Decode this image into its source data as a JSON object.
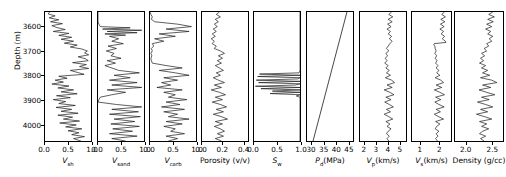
{
  "figure": {
    "kind": "well-log-panel",
    "n_tracks": 9,
    "y_axis": {
      "label": "Depth (m)",
      "ticks": [
        3600,
        3700,
        3800,
        3900,
        4000
      ],
      "tick_labels": [
        "3600",
        "3700",
        "3800",
        "3900",
        "4000"
      ],
      "range": [
        4070,
        3540
      ],
      "inverted": true,
      "units": "m"
    },
    "line_color": "#1a1a1a"
  },
  "chart_data": [
    {
      "type": "line",
      "name": "vsh",
      "title": "",
      "xlabel": "V_sh",
      "xlabel_base": "V",
      "xlabel_sub": "sh",
      "ylabel": "Depth (m)",
      "xticks": [
        0.0,
        0.5,
        1.0
      ],
      "xtick_labels": [
        "0.0",
        "0.5",
        "1.0"
      ],
      "xlim": [
        0.0,
        1.0
      ],
      "ylim": [
        4070,
        3540
      ],
      "grid": false,
      "x": [
        3540,
        3548,
        3556,
        3564,
        3572,
        3580,
        3588,
        3596,
        3604,
        3612,
        3620,
        3628,
        3636,
        3644,
        3652,
        3660,
        3668,
        3676,
        3684,
        3692,
        3700,
        3708,
        3716,
        3724,
        3732,
        3740,
        3748,
        3756,
        3764,
        3772,
        3780,
        3788,
        3796,
        3804,
        3812,
        3820,
        3828,
        3836,
        3844,
        3852,
        3860,
        3868,
        3876,
        3884,
        3892,
        3900,
        3908,
        3916,
        3924,
        3932,
        3940,
        3948,
        3956,
        3964,
        3972,
        3980,
        3988,
        3996,
        4004,
        4012,
        4020,
        4028,
        4036,
        4044,
        4052,
        4060,
        4070
      ],
      "values": [
        0.1,
        0.07,
        0.22,
        0.09,
        0.3,
        0.12,
        0.38,
        0.15,
        0.26,
        0.44,
        0.18,
        0.52,
        0.3,
        0.58,
        0.35,
        0.62,
        0.42,
        0.7,
        0.55,
        0.8,
        0.92,
        0.86,
        0.95,
        0.72,
        0.88,
        0.94,
        0.6,
        0.9,
        0.75,
        0.95,
        0.55,
        0.7,
        0.85,
        0.3,
        0.48,
        0.22,
        0.4,
        0.15,
        0.52,
        0.28,
        0.62,
        0.35,
        0.7,
        0.25,
        0.55,
        0.18,
        0.45,
        0.3,
        0.66,
        0.24,
        0.58,
        0.35,
        0.72,
        0.28,
        0.6,
        0.4,
        0.75,
        0.32,
        0.68,
        0.45,
        0.8,
        0.5,
        0.74,
        0.58,
        0.86,
        0.62,
        0.78
      ]
    },
    {
      "type": "line",
      "name": "vsand",
      "xlabel": "V_sand",
      "xlabel_base": "V",
      "xlabel_sub": "sand",
      "xticks": [
        0.0,
        0.5,
        1.0
      ],
      "xtick_labels": [
        "0.0",
        "0.5",
        "1.0"
      ],
      "xlim": [
        0.0,
        1.0
      ],
      "ylim": [
        4070,
        3540
      ],
      "grid": false,
      "x": [
        3540,
        3550,
        3560,
        3570,
        3580,
        3590,
        3600,
        3605,
        3610,
        3615,
        3620,
        3625,
        3630,
        3635,
        3640,
        3650,
        3660,
        3670,
        3680,
        3690,
        3700,
        3710,
        3720,
        3730,
        3740,
        3750,
        3760,
        3770,
        3780,
        3790,
        3800,
        3810,
        3820,
        3830,
        3840,
        3850,
        3860,
        3870,
        3880,
        3890,
        3900,
        3910,
        3920,
        3930,
        3940,
        3950,
        3960,
        3970,
        3980,
        3990,
        4000,
        4010,
        4020,
        4030,
        4040,
        4050,
        4060,
        4070
      ],
      "values": [
        0.0,
        0.0,
        0.0,
        0.0,
        0.0,
        0.02,
        0.05,
        0.7,
        0.1,
        0.95,
        0.2,
        0.85,
        0.15,
        0.6,
        0.25,
        0.45,
        0.3,
        0.55,
        0.22,
        0.4,
        0.18,
        0.35,
        0.28,
        0.5,
        0.2,
        0.38,
        0.15,
        0.3,
        0.45,
        0.9,
        0.35,
        0.7,
        0.25,
        0.85,
        0.3,
        0.95,
        0.2,
        0.6,
        0.3,
        0.05,
        0.02,
        0.0,
        0.4,
        0.95,
        0.3,
        0.88,
        0.25,
        0.92,
        0.35,
        0.8,
        0.28,
        0.9,
        0.32,
        0.75,
        0.25,
        0.85,
        0.3,
        0.6
      ]
    },
    {
      "type": "line",
      "name": "vcarb",
      "xlabel": "V_carb",
      "xlabel_base": "V",
      "xlabel_sub": "carb",
      "xticks": [
        0.0,
        0.5,
        1.0
      ],
      "xtick_labels": [
        "0.0",
        "0.5",
        "1.0"
      ],
      "xlim": [
        0.0,
        1.0
      ],
      "ylim": [
        4070,
        3540
      ],
      "grid": false,
      "x": [
        3540,
        3550,
        3560,
        3570,
        3580,
        3590,
        3600,
        3610,
        3620,
        3630,
        3640,
        3650,
        3660,
        3670,
        3680,
        3690,
        3700,
        3710,
        3720,
        3730,
        3740,
        3750,
        3760,
        3770,
        3780,
        3790,
        3800,
        3810,
        3820,
        3830,
        3840,
        3850,
        3860,
        3870,
        3880,
        3890,
        3900,
        3910,
        3920,
        3930,
        3940,
        3950,
        3960,
        3970,
        3980,
        3990,
        4000,
        4010,
        4020,
        4030,
        4040,
        4050,
        4060,
        4070
      ],
      "values": [
        0.0,
        0.02,
        0.05,
        0.03,
        0.1,
        0.6,
        0.9,
        0.35,
        0.85,
        0.2,
        0.55,
        0.1,
        0.3,
        0.05,
        0.08,
        0.03,
        0.05,
        0.02,
        0.04,
        0.02,
        0.03,
        0.05,
        0.35,
        0.7,
        0.2,
        0.55,
        0.85,
        0.3,
        0.6,
        0.25,
        0.45,
        0.15,
        0.7,
        0.3,
        0.55,
        0.4,
        0.8,
        0.35,
        0.65,
        0.25,
        0.75,
        0.3,
        0.6,
        0.4,
        0.85,
        0.35,
        0.7,
        0.3,
        0.55,
        0.45,
        0.75,
        0.35,
        0.6,
        0.4
      ]
    },
    {
      "type": "line",
      "name": "porosity",
      "xlabel": "Porosity (v/v)",
      "xticks": [
        0.0,
        0.2,
        0.4
      ],
      "xtick_labels": [
        "0.0",
        "0.2",
        "0.4"
      ],
      "xlim": [
        0.0,
        0.45
      ],
      "ylim": [
        4070,
        3540
      ],
      "grid": false,
      "units": "v/v",
      "x": [
        3540,
        3550,
        3560,
        3570,
        3580,
        3590,
        3600,
        3610,
        3620,
        3630,
        3640,
        3650,
        3660,
        3670,
        3680,
        3690,
        3700,
        3710,
        3720,
        3730,
        3740,
        3750,
        3760,
        3770,
        3780,
        3790,
        3800,
        3810,
        3820,
        3830,
        3840,
        3850,
        3860,
        3870,
        3880,
        3890,
        3900,
        3910,
        3920,
        3930,
        3940,
        3950,
        3960,
        3970,
        3980,
        3990,
        4000,
        4010,
        4020,
        4030,
        4040,
        4050,
        4060,
        4070
      ],
      "values": [
        0.17,
        0.14,
        0.18,
        0.13,
        0.16,
        0.12,
        0.15,
        0.11,
        0.14,
        0.1,
        0.13,
        0.09,
        0.12,
        0.1,
        0.14,
        0.12,
        0.18,
        0.22,
        0.16,
        0.2,
        0.15,
        0.19,
        0.13,
        0.17,
        0.21,
        0.14,
        0.18,
        0.11,
        0.16,
        0.22,
        0.12,
        0.19,
        0.09,
        0.17,
        0.23,
        0.13,
        0.2,
        0.1,
        0.18,
        0.24,
        0.14,
        0.21,
        0.11,
        0.19,
        0.25,
        0.13,
        0.2,
        0.12,
        0.18,
        0.22,
        0.15,
        0.21,
        0.13,
        0.19
      ]
    },
    {
      "type": "line",
      "name": "sw",
      "xlabel": "S_w",
      "xlabel_base": "S",
      "xlabel_sub": "w",
      "xticks": [
        0.0,
        0.5,
        1.0
      ],
      "xtick_labels": [
        "0.0",
        "0.5",
        "1.0"
      ],
      "xlim": [
        0.0,
        1.0
      ],
      "ylim": [
        4070,
        3540
      ],
      "grid": false,
      "x": [
        3540,
        3600,
        3660,
        3720,
        3780,
        3790,
        3795,
        3800,
        3805,
        3810,
        3815,
        3820,
        3825,
        3830,
        3835,
        3840,
        3845,
        3850,
        3855,
        3860,
        3865,
        3870,
        3875,
        3880,
        3885,
        3890,
        3900,
        3960,
        4020,
        4070
      ],
      "values": [
        1.0,
        1.0,
        1.0,
        1.0,
        1.0,
        0.98,
        0.12,
        1.0,
        0.08,
        1.0,
        0.95,
        0.05,
        1.0,
        0.1,
        1.0,
        0.9,
        0.03,
        1.0,
        0.15,
        1.0,
        0.4,
        1.0,
        0.35,
        1.0,
        0.92,
        1.0,
        1.0,
        1.0,
        1.0,
        1.0
      ]
    },
    {
      "type": "line",
      "name": "pd",
      "xlabel": "P_d(MPa)",
      "xlabel_base": "P",
      "xlabel_sub": "d",
      "xlabel_suffix": "(MPa)",
      "xticks": [
        30,
        35,
        40,
        45
      ],
      "xtick_labels": [
        "30",
        "35",
        "40",
        "45"
      ],
      "xlim": [
        28,
        47
      ],
      "ylim": [
        4070,
        3540
      ],
      "grid": false,
      "units": "MPa",
      "x": [
        3540,
        4070
      ],
      "values": [
        44.5,
        30.5
      ]
    },
    {
      "type": "line",
      "name": "vp",
      "xlabel": "V_p(km/s)",
      "xlabel_base": "V",
      "xlabel_sub": "p",
      "xlabel_suffix": "(km/s)",
      "xticks": [
        2,
        3,
        4,
        5
      ],
      "xtick_labels": [
        "2",
        "3",
        "4",
        "5"
      ],
      "xlim": [
        1.6,
        5.6
      ],
      "ylim": [
        4070,
        3540
      ],
      "grid": false,
      "units": "km/s",
      "x": [
        3540,
        3550,
        3560,
        3570,
        3580,
        3590,
        3600,
        3610,
        3620,
        3630,
        3640,
        3650,
        3660,
        3670,
        3680,
        3690,
        3700,
        3710,
        3720,
        3730,
        3740,
        3750,
        3760,
        3770,
        3780,
        3790,
        3800,
        3810,
        3820,
        3830,
        3840,
        3850,
        3860,
        3870,
        3880,
        3890,
        3900,
        3910,
        3920,
        3930,
        3940,
        3950,
        3960,
        3970,
        3980,
        3990,
        4000,
        4010,
        4020,
        4030,
        4040,
        4050,
        4060,
        4070
      ],
      "values": [
        4.35,
        4.1,
        4.45,
        4.05,
        4.4,
        4.0,
        4.3,
        3.95,
        4.25,
        4.05,
        4.35,
        4.15,
        4.4,
        4.2,
        4.05,
        3.9,
        4.1,
        3.85,
        4.0,
        3.8,
        3.95,
        3.75,
        4.05,
        3.85,
        4.15,
        3.9,
        4.25,
        3.8,
        4.35,
        4.6,
        3.95,
        4.4,
        3.7,
        4.2,
        4.55,
        3.85,
        4.3,
        3.75,
        4.15,
        4.5,
        3.9,
        4.25,
        3.7,
        4.1,
        4.45,
        3.85,
        4.2,
        3.95,
        4.3,
        4.05,
        3.9,
        4.15,
        3.95,
        4.1
      ]
    },
    {
      "type": "line",
      "name": "vs",
      "xlabel": "V_s(km/s)",
      "xlabel_base": "V",
      "xlabel_sub": "s",
      "xlabel_suffix": "(km/s)",
      "xticks": [
        1,
        2
      ],
      "xtick_labels": [
        "1",
        "2"
      ],
      "xlim": [
        0.55,
        2.65
      ],
      "ylim": [
        4070,
        3540
      ],
      "grid": false,
      "units": "km/s",
      "x": [
        3540,
        3550,
        3560,
        3570,
        3580,
        3590,
        3600,
        3610,
        3620,
        3630,
        3640,
        3650,
        3660,
        3665,
        3670,
        3675,
        3680,
        3690,
        3700,
        3710,
        3720,
        3730,
        3740,
        3750,
        3760,
        3770,
        3780,
        3790,
        3800,
        3810,
        3820,
        3830,
        3840,
        3850,
        3860,
        3870,
        3880,
        3890,
        3900,
        3910,
        3920,
        3930,
        3940,
        3950,
        3960,
        3970,
        3980,
        3990,
        4000,
        4010,
        4020,
        4030,
        4040,
        4050,
        4060,
        4070
      ],
      "values": [
        2.3,
        2.15,
        2.35,
        2.1,
        2.32,
        2.08,
        2.28,
        2.05,
        2.25,
        2.12,
        2.3,
        2.18,
        2.35,
        2.38,
        1.75,
        1.72,
        1.78,
        1.8,
        1.85,
        1.78,
        1.88,
        1.8,
        1.9,
        1.82,
        1.95,
        1.85,
        2.0,
        1.88,
        2.05,
        1.8,
        2.1,
        2.25,
        1.85,
        2.15,
        1.75,
        2.05,
        2.3,
        1.82,
        2.1,
        1.78,
        2.0,
        2.28,
        1.85,
        2.08,
        1.75,
        1.98,
        2.25,
        1.82,
        2.05,
        1.88,
        1.8,
        2.0,
        1.85,
        1.95,
        1.82,
        1.92
      ]
    },
    {
      "type": "line",
      "name": "density",
      "xlabel": "Density (g/cc)",
      "xticks": [
        2.0,
        2.5
      ],
      "xtick_labels": [
        "2.0",
        "2.5"
      ],
      "xlim": [
        1.78,
        2.72
      ],
      "ylim": [
        4070,
        3540
      ],
      "grid": false,
      "units": "g/cc",
      "x": [
        3540,
        3550,
        3560,
        3570,
        3580,
        3590,
        3600,
        3610,
        3620,
        3630,
        3640,
        3650,
        3660,
        3670,
        3680,
        3690,
        3700,
        3710,
        3720,
        3730,
        3740,
        3750,
        3760,
        3770,
        3780,
        3790,
        3800,
        3810,
        3820,
        3830,
        3840,
        3850,
        3860,
        3870,
        3880,
        3890,
        3900,
        3910,
        3920,
        3930,
        3940,
        3950,
        3960,
        3970,
        3980,
        3990,
        4000,
        4010,
        4020,
        4030,
        4040,
        4050,
        4060,
        4070
      ],
      "values": [
        2.52,
        2.44,
        2.55,
        2.42,
        2.53,
        2.4,
        2.5,
        2.38,
        2.48,
        2.42,
        2.52,
        2.45,
        2.5,
        2.4,
        2.44,
        2.35,
        2.4,
        2.3,
        2.36,
        2.28,
        2.34,
        2.26,
        2.38,
        2.3,
        2.42,
        2.32,
        2.46,
        2.28,
        2.5,
        2.6,
        2.32,
        2.48,
        2.25,
        2.4,
        2.56,
        2.3,
        2.45,
        2.22,
        2.38,
        2.52,
        2.28,
        2.42,
        2.2,
        2.36,
        2.5,
        2.26,
        2.4,
        2.3,
        2.44,
        2.32,
        2.26,
        2.38,
        2.28,
        2.35
      ]
    }
  ]
}
